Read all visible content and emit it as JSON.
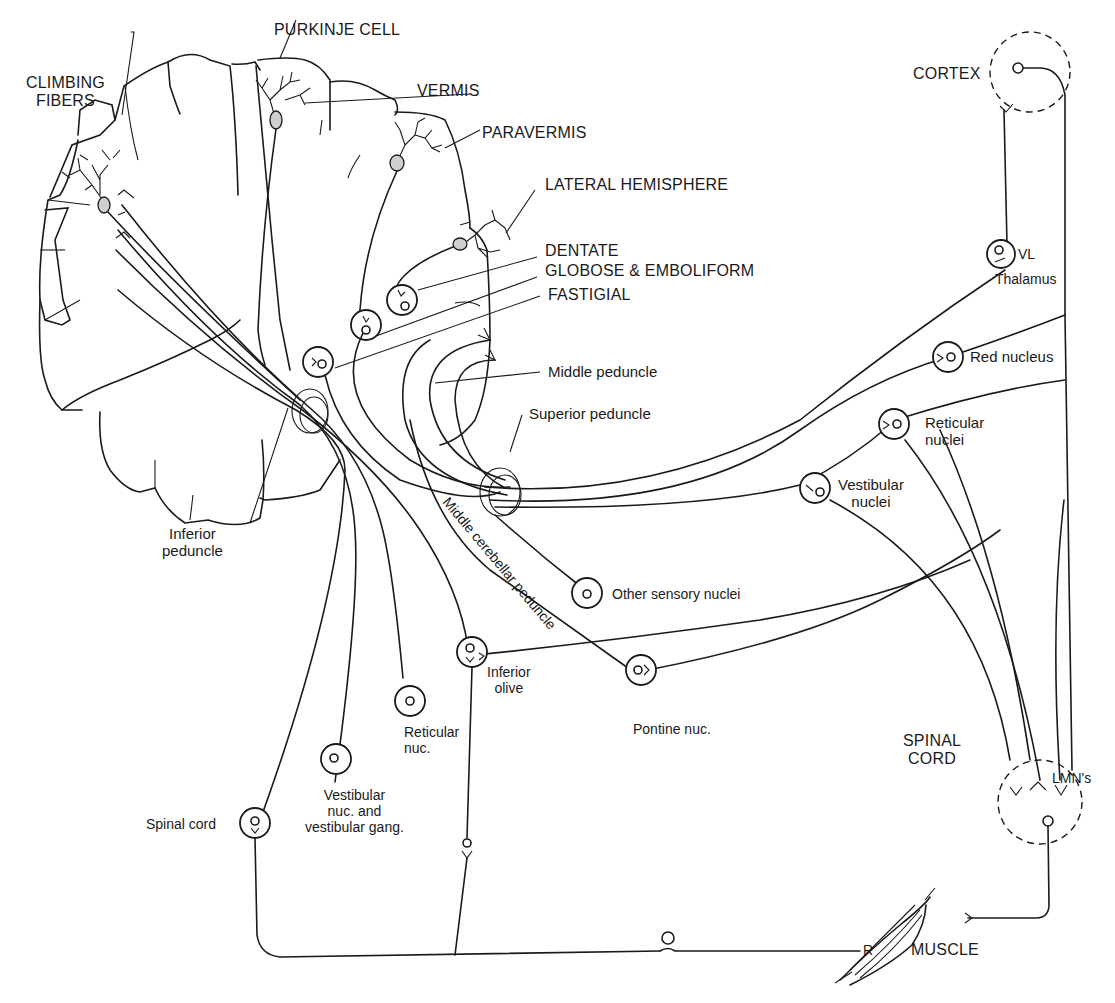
{
  "diagram": {
    "type": "neuroanatomy-pathways",
    "background_color": "#ffffff",
    "line_color": "#1a1a1a"
  },
  "cerebellum_labels": {
    "purkinje_cell": "PURKINJE CELL",
    "climbing_fibers": "CLIMBING\nFIBERS",
    "vermis": "VERMIS",
    "paravermis": "PARAVERMIS",
    "lateral_hemisphere": "LATERAL HEMISPHERE",
    "dentate": "DENTATE",
    "globose_emboliform": "GLOBOSE & EMBOLIFORM",
    "fastigial": "FASTIGIAL"
  },
  "peduncles": {
    "middle": "Middle peduncle",
    "superior": "Superior peduncle",
    "inferior": "Inferior\npeduncle",
    "middle_cerebellar": "Middle cerebellar peduncle"
  },
  "targets": {
    "cortex": "CORTEX",
    "vl": "VL",
    "thalamus": "Thalamus",
    "red_nucleus": "Red nucleus",
    "reticular_nuclei": "Reticular\nnuclei",
    "vestibular_nuclei": "Vestibular\nnuclei",
    "spinal_cord_caps": "SPINAL\nCORD",
    "lmns": "LMN's",
    "muscle": "MUSCLE",
    "receptor": "R"
  },
  "sources": {
    "other_sensory": "Other sensory nuclei",
    "inferior_olive": "Inferior\nolive",
    "pontine": "Pontine nuc.",
    "reticular_nuc": "Reticular\nnuc.",
    "vestibular_nuc": "Vestibular\nnuc. and\nvestibular gang.",
    "spinal_cord": "Spinal cord"
  }
}
